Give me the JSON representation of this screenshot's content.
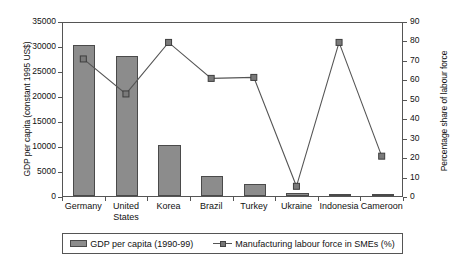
{
  "chart_data": {
    "type": "bar",
    "title": "",
    "subtitle": "",
    "categories": [
      "Germany",
      "United\nStates",
      "Korea",
      "Brazil",
      "Turkey",
      "Ukraine",
      "Indonesia",
      "Cameroon"
    ],
    "xlabel": "",
    "grid": false,
    "legend_position": "bottom",
    "axes": {
      "left": {
        "label": "GDP per capita (constant 1995 US$)",
        "ticks": [
          "0",
          "5000",
          "10000",
          "15000",
          "20000",
          "25000",
          "30000",
          "35000"
        ],
        "tick_values": [
          0,
          5000,
          10000,
          15000,
          20000,
          25000,
          30000,
          35000
        ],
        "ylim": [
          0,
          35000
        ]
      },
      "right": {
        "label": "Percentage share of labour force",
        "ticks": [
          "0",
          "10",
          "20",
          "30",
          "40",
          "50",
          "60",
          "70",
          "80",
          "90"
        ],
        "tick_values": [
          0,
          10,
          20,
          30,
          40,
          50,
          60,
          70,
          80,
          90
        ],
        "ylim": [
          0,
          90
        ]
      }
    },
    "series": [
      {
        "name": "GDP per capita (1990-99)",
        "type": "bar",
        "axis": "left",
        "color": "#8c8c8c",
        "values": [
          30200,
          28100,
          10200,
          4000,
          2400,
          700,
          400,
          200
        ]
      },
      {
        "name": "Manufacturing labour force in SMEs (%)",
        "type": "line",
        "axis": "right",
        "color": "#555555",
        "values": [
          71,
          53,
          79.5,
          61,
          61.5,
          5.5,
          79.5,
          21
        ]
      }
    ]
  },
  "legend": {
    "items": [
      {
        "label": "GDP per capita (1990-99)",
        "marker": "bar-swatch"
      },
      {
        "label": "Manufacturing labour force in SMEs (%)",
        "marker": "line-square-marker"
      }
    ]
  }
}
